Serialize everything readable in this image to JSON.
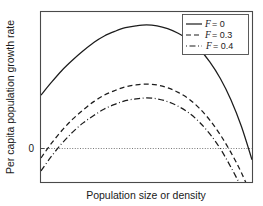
{
  "chart_data": {
    "type": "line",
    "title": "",
    "xlabel": "Population size or density",
    "ylabel": "Per capita population growth rate",
    "xlim": [
      0,
      100
    ],
    "ylim": [
      -30,
      62
    ],
    "grid": false,
    "y_ticks": [
      "0"
    ],
    "x_ticks": [],
    "zero_line": true,
    "legend": {
      "position": "top-right",
      "entries": [
        {
          "label_var": "F",
          "label_eq": "= 0",
          "label": "F = 0",
          "style": "solid"
        },
        {
          "label_var": "F",
          "label_eq": "= 0.3",
          "label": "F = 0.3",
          "style": "dashed"
        },
        {
          "label_var": "F",
          "label_eq": "= 0.4",
          "label": "F = 0.4",
          "style": "dash-dot"
        }
      ]
    },
    "series": [
      {
        "name": "F = 0",
        "style": "solid",
        "color": "#1c1c1c",
        "x": [
          0,
          5,
          10,
          15,
          20,
          25,
          30,
          35,
          40,
          45,
          50,
          55,
          60,
          65,
          70,
          75,
          80,
          85,
          90,
          95,
          100
        ],
        "y": [
          17,
          24,
          30.5,
          36,
          41,
          45.5,
          49,
          51.5,
          53.5,
          54.5,
          55,
          54.5,
          53,
          50.5,
          47,
          42,
          35,
          26,
          14.5,
          0,
          -18
        ]
      },
      {
        "name": "F = 0.3",
        "style": "dashed",
        "color": "#1c1c1c",
        "x": [
          0,
          5,
          10,
          15,
          20,
          25,
          30,
          35,
          40,
          45,
          50,
          55,
          60,
          65,
          70,
          75,
          80,
          85,
          90,
          95,
          100
        ],
        "y": [
          -17,
          -9,
          -2,
          4,
          9,
          13.5,
          17,
          19.5,
          21.5,
          22.5,
          23,
          22.5,
          21,
          18.5,
          15,
          10,
          3.5,
          -4.5,
          -14,
          -25,
          -38
        ]
      },
      {
        "name": "F = 0.4",
        "style": "dash-dot",
        "color": "#1c1c1c",
        "x": [
          0,
          5,
          10,
          15,
          20,
          25,
          30,
          35,
          40,
          45,
          50,
          55,
          60,
          65,
          70,
          75,
          80,
          85,
          90,
          95,
          100
        ],
        "y": [
          -24,
          -16,
          -9,
          -3,
          2,
          6,
          9.5,
          12,
          14,
          15,
          15.5,
          15,
          13.5,
          11,
          7.5,
          2.5,
          -4,
          -12,
          -22,
          -33,
          -46
        ]
      }
    ]
  },
  "axes": {
    "y_tick_zero": "0",
    "x_title": "Population size or density",
    "y_title": "Per capita population growth rate"
  },
  "legend": {
    "entry_0_var": "F",
    "entry_0_val": "= 0",
    "entry_1_var": "F",
    "entry_1_val": "= 0.3",
    "entry_2_var": "F",
    "entry_2_val": "= 0.4"
  },
  "colors": {
    "curve": "#1c1c1c",
    "frame": "#4a4a4a",
    "zero_line": "#555555",
    "background": "#ffffff"
  }
}
